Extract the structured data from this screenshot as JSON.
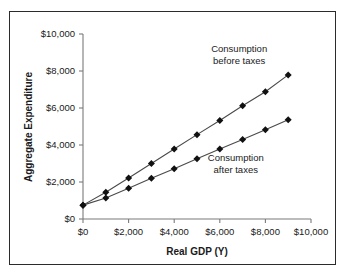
{
  "figure": {
    "border_color": "#2b2b2b",
    "background": "#ffffff"
  },
  "chart_data": {
    "type": "line",
    "title": "",
    "xlabel": "Real GDP (Y)",
    "ylabel": "Aggregate Expenditure",
    "xlim": [
      0,
      10000
    ],
    "ylim": [
      0,
      10000
    ],
    "grid": false,
    "legend_position": "inline-annotation",
    "x_tick_labels": [
      "$0",
      "$2,000",
      "$4,000",
      "$6,000",
      "$8,000",
      "$10,000"
    ],
    "x_tick_values": [
      0,
      2000,
      4000,
      6000,
      8000,
      10000
    ],
    "y_tick_labels": [
      "$0",
      "$2,000",
      "$4,000",
      "$6,000",
      "$8,000",
      "$10,000"
    ],
    "y_tick_values": [
      0,
      2000,
      4000,
      6000,
      8000,
      10000
    ],
    "x": [
      0,
      1000,
      2000,
      3000,
      4000,
      5000,
      6000,
      7000,
      8000,
      9000
    ],
    "series": [
      {
        "name": "Consumption before taxes",
        "marker": "diamond",
        "color": "#111111",
        "values": [
          750,
          1450,
          2220,
          3000,
          3780,
          4560,
          5320,
          6120,
          6880,
          7790
        ]
      },
      {
        "name": "Consumption after taxes",
        "marker": "diamond",
        "color": "#111111",
        "values": [
          750,
          1130,
          1660,
          2200,
          2720,
          3260,
          3780,
          4300,
          4830,
          5360
        ]
      }
    ],
    "annotations": [
      {
        "id": "annotation-before-taxes",
        "line1": "Consumption",
        "line2": "before taxes",
        "x": 6850,
        "y": 9050
      },
      {
        "id": "annotation-after-taxes",
        "line1": "Consumption",
        "line2": "after taxes",
        "x": 6700,
        "y": 3150
      }
    ]
  }
}
